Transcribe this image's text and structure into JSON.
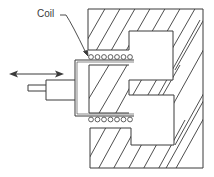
{
  "diagram": {
    "labels": {
      "coil": "Coil"
    },
    "colors": {
      "stroke": "#3a3a3a",
      "background": "#ffffff"
    },
    "components": [
      {
        "name": "magnet-body",
        "description": "Hatched magnetic body (outer yoke)"
      },
      {
        "name": "center-pole",
        "description": "Hatched center pole"
      },
      {
        "name": "coil-former",
        "description": "Cup-shaped coil former"
      },
      {
        "name": "coil-windings-top",
        "count": 7
      },
      {
        "name": "coil-windings-bottom",
        "count": 7
      },
      {
        "name": "output-shaft",
        "description": "Stepped shaft"
      },
      {
        "name": "motion-arrow",
        "description": "Bidirectional motion arrow"
      }
    ]
  }
}
